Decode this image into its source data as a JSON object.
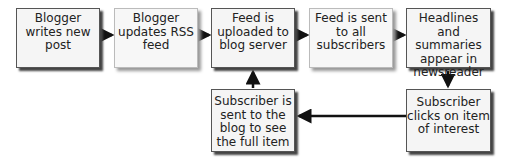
{
  "diagram": {
    "type": "flowchart",
    "nodes": [
      {
        "id": "n1",
        "label": "Blogger writes new post",
        "lines": [
          "Blogger",
          "writes new",
          "post"
        ]
      },
      {
        "id": "n2",
        "label": "Blogger updates RSS feed",
        "lines": [
          "Blogger",
          "updates RSS",
          "feed"
        ]
      },
      {
        "id": "n3",
        "label": "Feed is uploaded to blog server",
        "lines": [
          "Feed is",
          "uploaded to",
          "blog server"
        ]
      },
      {
        "id": "n4",
        "label": "Feed is sent to all subscribers",
        "lines": [
          "Feed is sent",
          "to all",
          "subscribers"
        ]
      },
      {
        "id": "n5",
        "label": "Headlines and summaries appear in newsreader",
        "lines": [
          "Headlines and",
          "summaries",
          "appear in",
          "newsreader"
        ]
      },
      {
        "id": "n6",
        "label": "Subscriber clicks on item of interest",
        "lines": [
          "Subscriber",
          "clicks on item",
          "of interest"
        ]
      },
      {
        "id": "n7",
        "label": "Subscriber is sent to the blog to see the full item",
        "lines": [
          "Subscriber is",
          "sent to the",
          "blog to see",
          "the full item"
        ]
      }
    ],
    "edges": [
      {
        "from": "n1",
        "to": "n2"
      },
      {
        "from": "n2",
        "to": "n3"
      },
      {
        "from": "n3",
        "to": "n4"
      },
      {
        "from": "n4",
        "to": "n5"
      },
      {
        "from": "n5",
        "to": "n6"
      },
      {
        "from": "n6",
        "to": "n7"
      },
      {
        "from": "n7",
        "to": "n3"
      }
    ]
  }
}
